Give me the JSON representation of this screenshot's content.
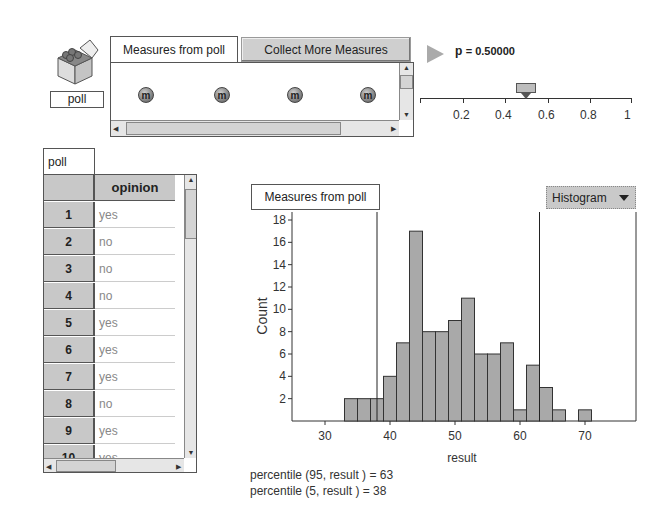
{
  "collection": {
    "name": "poll",
    "icon": "box-icon"
  },
  "measures_panel": {
    "tab_label": "Measures from poll",
    "collect_button": "Collect More Measures",
    "measure_glyph": "m",
    "measure_count_visible": 4
  },
  "slider": {
    "label": "p",
    "value_text": "= 0.50000",
    "value": 0.5,
    "ticks": [
      "0.2",
      "0.4",
      "0.6",
      "0.8",
      "1"
    ]
  },
  "table": {
    "tab_label": "poll",
    "column_header": "opinion",
    "rows": [
      {
        "index": "1",
        "opinion": "yes"
      },
      {
        "index": "2",
        "opinion": "no"
      },
      {
        "index": "3",
        "opinion": "no"
      },
      {
        "index": "4",
        "opinion": "no"
      },
      {
        "index": "5",
        "opinion": "yes"
      },
      {
        "index": "6",
        "opinion": "yes"
      },
      {
        "index": "7",
        "opinion": "yes"
      },
      {
        "index": "8",
        "opinion": "no"
      },
      {
        "index": "9",
        "opinion": "yes"
      },
      {
        "index": "10",
        "opinion": "yes"
      }
    ]
  },
  "graph": {
    "title": "Measures from poll",
    "type_button": "Histogram",
    "formulas": [
      "percentile (95, result ) = 63",
      "percentile (5, result ) = 38"
    ]
  },
  "chart_data": {
    "type": "bar",
    "title": "Measures from poll",
    "xlabel": "result",
    "ylabel": "Count",
    "bin_width": 2,
    "bin_starts": [
      33,
      35,
      37,
      39,
      41,
      43,
      45,
      47,
      49,
      51,
      53,
      55,
      57,
      59,
      61,
      63,
      65,
      67,
      69
    ],
    "values": [
      2,
      2,
      2,
      4,
      7,
      17,
      8,
      8,
      9,
      11,
      6,
      6,
      7,
      1,
      5,
      3,
      1,
      0,
      1
    ],
    "x_ticks": [
      "30",
      "40",
      "50",
      "60",
      "70"
    ],
    "y_ticks": [
      "2",
      "4",
      "6",
      "8",
      "10",
      "12",
      "14",
      "16",
      "18"
    ],
    "xlim": [
      22.5,
      78
    ],
    "ylim": [
      0,
      18
    ],
    "reference_lines": [
      {
        "label": "percentile 5",
        "x": 38
      },
      {
        "label": "percentile 95",
        "x": 63
      }
    ],
    "bar_color": "#a9a9a9"
  }
}
